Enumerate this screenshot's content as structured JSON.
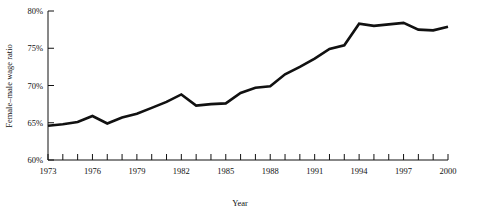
{
  "chart_data": {
    "type": "line",
    "title": "",
    "xlabel": "Year",
    "ylabel": "Female–male wage ratio",
    "xlim": [
      1973,
      2000
    ],
    "ylim": [
      60,
      80
    ],
    "grid": false,
    "legend": "none",
    "y_tick_values": [
      60,
      65,
      70,
      75,
      80
    ],
    "y_tick_labels": [
      "60%",
      "65%",
      "70%",
      "75%",
      "80%"
    ],
    "x_tick_values": [
      1973,
      1974,
      1975,
      1976,
      1977,
      1978,
      1979,
      1980,
      1981,
      1982,
      1983,
      1984,
      1985,
      1986,
      1987,
      1988,
      1989,
      1990,
      1991,
      1992,
      1993,
      1994,
      1995,
      1996,
      1997,
      1998,
      1999,
      2000
    ],
    "x_tick_labels": [
      "1973",
      "",
      "",
      "1976",
      "",
      "",
      "1979",
      "",
      "",
      "1982",
      "",
      "",
      "1985",
      "",
      "",
      "1988",
      "",
      "",
      "1991",
      "",
      "",
      "1994",
      "",
      "",
      "1997",
      "",
      "",
      "2000"
    ],
    "x": [
      1973,
      1974,
      1975,
      1976,
      1977,
      1978,
      1979,
      1980,
      1981,
      1982,
      1983,
      1984,
      1985,
      1986,
      1987,
      1988,
      1989,
      1990,
      1991,
      1992,
      1993,
      1994,
      1995,
      1996,
      1997,
      1998,
      1999,
      2000
    ],
    "values": [
      64.6,
      64.8,
      65.1,
      65.9,
      64.9,
      65.7,
      66.2,
      67.0,
      67.8,
      68.8,
      67.3,
      67.5,
      67.6,
      69.0,
      69.7,
      69.9,
      71.5,
      72.5,
      73.6,
      74.9,
      75.4,
      78.3,
      78.0,
      78.2,
      78.4,
      77.5,
      77.4,
      77.9
    ],
    "series": [
      {
        "name": "Female–male wage ratio",
        "color": "#111111",
        "values": [
          64.6,
          64.8,
          65.1,
          65.9,
          64.9,
          65.7,
          66.2,
          67.0,
          67.8,
          68.8,
          67.3,
          67.5,
          67.6,
          69.0,
          69.7,
          69.9,
          71.5,
          72.5,
          73.6,
          74.9,
          75.4,
          78.3,
          78.0,
          78.2,
          78.4,
          77.5,
          77.4,
          77.9
        ]
      }
    ]
  },
  "axes": {
    "x_title": "Year",
    "y_title": "Female–male wage ratio"
  }
}
